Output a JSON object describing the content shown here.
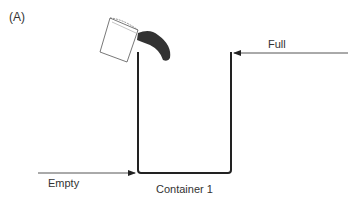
{
  "panel_label": "(A)",
  "labels": {
    "full": "Full",
    "empty": "Empty",
    "container": "Container 1"
  },
  "icons": {
    "bucket": "pouring-bucket-icon"
  }
}
